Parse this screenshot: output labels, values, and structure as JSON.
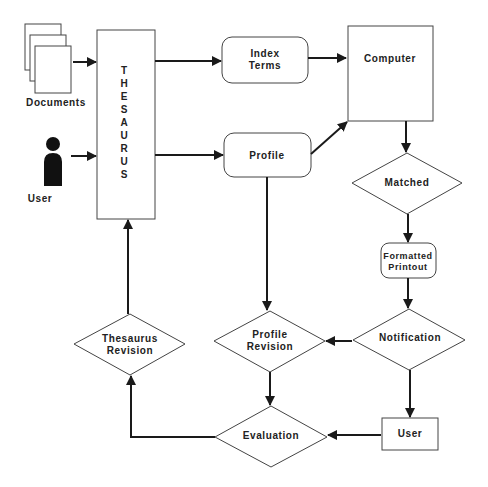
{
  "diagram": {
    "nodes": {
      "documents": {
        "label": "Documents",
        "shape": "document-stack-icon"
      },
      "user_input": {
        "label": "User",
        "shape": "person-icon"
      },
      "thesaurus": {
        "label": "THESAURUS",
        "letters": [
          "T",
          "H",
          "E",
          "S",
          "A",
          "U",
          "R",
          "U",
          "S"
        ],
        "shape": "rectangle"
      },
      "index_terms": {
        "label_lines": [
          "Index",
          "Terms"
        ],
        "shape": "rounded-rectangle"
      },
      "profile": {
        "label": "Profile",
        "shape": "rounded-rectangle"
      },
      "computer": {
        "label": "Computer",
        "shape": "rectangle"
      },
      "matched": {
        "label": "Matched",
        "shape": "diamond"
      },
      "formatted_printout": {
        "label_lines": [
          "Formatted",
          "Printout"
        ],
        "shape": "rounded-rectangle"
      },
      "notification": {
        "label": "Notification",
        "shape": "diamond"
      },
      "profile_revision": {
        "label_lines": [
          "Profile",
          "Revision"
        ],
        "shape": "diamond"
      },
      "thesaurus_revision": {
        "label_lines": [
          "Thesaurus",
          "Revision"
        ],
        "shape": "diamond"
      },
      "evaluation": {
        "label": "Evaluation",
        "shape": "diamond"
      },
      "user_output": {
        "label": "User",
        "shape": "rectangle"
      }
    },
    "edges": [
      {
        "from": "documents",
        "to": "thesaurus"
      },
      {
        "from": "user_input",
        "to": "thesaurus"
      },
      {
        "from": "thesaurus",
        "to": "index_terms"
      },
      {
        "from": "thesaurus",
        "to": "profile"
      },
      {
        "from": "index_terms",
        "to": "computer"
      },
      {
        "from": "profile",
        "to": "computer"
      },
      {
        "from": "profile",
        "to": "profile_revision"
      },
      {
        "from": "computer",
        "to": "matched"
      },
      {
        "from": "matched",
        "to": "formatted_printout"
      },
      {
        "from": "formatted_printout",
        "to": "notification"
      },
      {
        "from": "notification",
        "to": "profile_revision"
      },
      {
        "from": "notification",
        "to": "user_output"
      },
      {
        "from": "user_output",
        "to": "evaluation"
      },
      {
        "from": "profile_revision",
        "to": "evaluation"
      },
      {
        "from": "evaluation",
        "to": "thesaurus_revision"
      },
      {
        "from": "thesaurus_revision",
        "to": "thesaurus"
      }
    ]
  }
}
